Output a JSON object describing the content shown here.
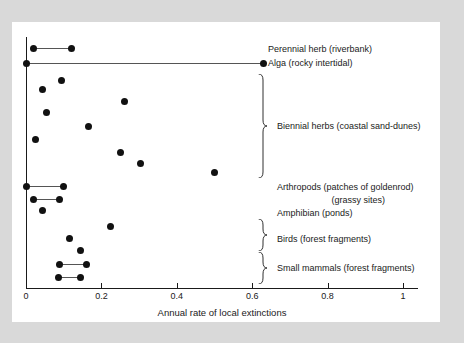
{
  "chart_data": {
    "type": "scatter",
    "title": "",
    "xlabel": "Annual rate of local extinctions",
    "ylabel": "",
    "xlim": [
      0,
      1.1
    ],
    "xticks": [
      0,
      0.2,
      0.4,
      0.6,
      0.8,
      1
    ],
    "xtick_labels": [
      "0",
      "0.2",
      "0.4",
      "0.6",
      "0.8",
      "1"
    ],
    "grid": false,
    "legend": "none",
    "groups": [
      {
        "name": "Perennial herb (riverbank)",
        "label": "Perennial herb (riverbank)",
        "brace": false,
        "rows": [
          {
            "values": [
              0.02,
              0.12
            ],
            "connected": true
          }
        ]
      },
      {
        "name": "Alga (rocky intertidal)",
        "label": "Alga (rocky intertidal)",
        "brace": false,
        "rows": [
          {
            "values": [
              0.0,
              0.63
            ],
            "connected": true
          }
        ]
      },
      {
        "name": "Biennial herbs (coastal sand-dunes)",
        "label": "Biennial herbs (coastal sand-dunes)",
        "brace": true,
        "rows": [
          {
            "values": [
              0.095
            ],
            "connected": false
          },
          {
            "values": [
              0.045
            ],
            "connected": false
          },
          {
            "values": [
              0.26
            ],
            "connected": false
          },
          {
            "values": [
              0.055
            ],
            "connected": false
          },
          {
            "values": [
              0.165
            ],
            "connected": false
          },
          {
            "values": [
              0.025
            ],
            "connected": false
          },
          {
            "values": [
              0.25
            ],
            "connected": false
          },
          {
            "values": [
              0.305
            ],
            "connected": false
          },
          {
            "values": [
              0.5
            ],
            "connected": false
          }
        ]
      },
      {
        "name": "Arthropods (patches of goldenrod)",
        "label": "Arthropods (patches of goldenrod)",
        "brace": false,
        "rows": [
          {
            "values": [
              0.0,
              0.1
            ],
            "connected": true
          }
        ]
      },
      {
        "name": "Arthropods (grassy sites)",
        "label": "(grassy sites)",
        "brace": false,
        "rows": [
          {
            "values": [
              0.02,
              0.09
            ],
            "connected": true
          }
        ]
      },
      {
        "name": "Amphibian (ponds)",
        "label": "Amphibian (ponds)",
        "brace": false,
        "rows": [
          {
            "values": [
              0.045
            ],
            "connected": false
          }
        ]
      },
      {
        "name": "Birds (forest fragments)",
        "label": "Birds (forest fragments)",
        "brace": true,
        "rows": [
          {
            "values": [
              0.225
            ],
            "connected": false
          },
          {
            "values": [
              0.115
            ],
            "connected": false
          },
          {
            "values": [
              0.145
            ],
            "connected": false
          }
        ]
      },
      {
        "name": "Small mammals (forest fragments)",
        "label": "Small mammals (forest fragments)",
        "brace": true,
        "rows": [
          {
            "values": [
              0.09,
              0.16
            ],
            "connected": true
          },
          {
            "values": [
              0.085,
              0.145
            ],
            "connected": true
          }
        ]
      }
    ],
    "points": [
      {
        "x": 0.02,
        "y_px": 48,
        "group": "Perennial herb (riverbank)"
      },
      {
        "x": 0.12,
        "y_px": 48,
        "group": "Perennial herb (riverbank)"
      },
      {
        "x": 0.0,
        "y_px": 63,
        "group": "Alga (rocky intertidal)"
      },
      {
        "x": 0.63,
        "y_px": 63,
        "group": "Alga (rocky intertidal)"
      },
      {
        "x": 0.095,
        "y_px": 80,
        "group": "Biennial herbs (coastal sand-dunes)"
      },
      {
        "x": 0.045,
        "y_px": 89,
        "group": "Biennial herbs (coastal sand-dunes)"
      },
      {
        "x": 0.26,
        "y_px": 101,
        "group": "Biennial herbs (coastal sand-dunes)"
      },
      {
        "x": 0.055,
        "y_px": 112,
        "group": "Biennial herbs (coastal sand-dunes)"
      },
      {
        "x": 0.165,
        "y_px": 126,
        "group": "Biennial herbs (coastal sand-dunes)"
      },
      {
        "x": 0.025,
        "y_px": 139,
        "group": "Biennial herbs (coastal sand-dunes)"
      },
      {
        "x": 0.25,
        "y_px": 152,
        "group": "Biennial herbs (coastal sand-dunes)"
      },
      {
        "x": 0.305,
        "y_px": 163,
        "group": "Biennial herbs (coastal sand-dunes)"
      },
      {
        "x": 0.5,
        "y_px": 172,
        "group": "Biennial herbs (coastal sand-dunes)"
      },
      {
        "x": 0.0,
        "y_px": 186,
        "group": "Arthropods (patches of goldenrod)"
      },
      {
        "x": 0.1,
        "y_px": 186,
        "group": "Arthropods (patches of goldenrod)"
      },
      {
        "x": 0.02,
        "y_px": 199,
        "group": "Arthropods (grassy sites)"
      },
      {
        "x": 0.09,
        "y_px": 199,
        "group": "Arthropods (grassy sites)"
      },
      {
        "x": 0.045,
        "y_px": 210,
        "group": "Amphibian (ponds)"
      },
      {
        "x": 0.225,
        "y_px": 226,
        "group": "Birds (forest fragments)"
      },
      {
        "x": 0.115,
        "y_px": 238,
        "group": "Birds (forest fragments)"
      },
      {
        "x": 0.145,
        "y_px": 250,
        "group": "Birds (forest fragments)"
      },
      {
        "x": 0.09,
        "y_px": 264,
        "group": "Small mammals (forest fragments)"
      },
      {
        "x": 0.16,
        "y_px": 264,
        "group": "Small mammals (forest fragments)"
      },
      {
        "x": 0.085,
        "y_px": 277,
        "group": "Small mammals (forest fragments)"
      },
      {
        "x": 0.145,
        "y_px": 277,
        "group": "Small mammals (forest fragments)"
      }
    ],
    "colors": {
      "marker": "#111111",
      "axis": "#1a1a1a",
      "range_line": "#555555",
      "panel_background": "#ffffff",
      "figure_background": "#d9d9d9"
    }
  },
  "annotations": {
    "labels": [
      {
        "text": "Perennial herb (riverbank)",
        "x_px": 268,
        "y_px": 44,
        "align": "left"
      },
      {
        "text": "Alga (rocky intertidal)",
        "x_px": 268,
        "y_px": 58,
        "align": "left"
      },
      {
        "text": "Biennial herbs (coastal sand-dunes)",
        "x_px": 277,
        "y_px": 121,
        "align": "left"
      },
      {
        "text": "Arthropods (patches of goldenrod)",
        "x_px": 277,
        "y_px": 182,
        "align": "left"
      },
      {
        "text": "(grassy sites)",
        "x_px": 385,
        "y_px": 195,
        "align": "right"
      },
      {
        "text": "Amphibian (ponds)",
        "x_px": 277,
        "y_px": 208,
        "align": "left"
      },
      {
        "text": "Birds (forest fragments)",
        "x_px": 277,
        "y_px": 234,
        "align": "left"
      },
      {
        "text": "Small mammals (forest fragments)",
        "x_px": 277,
        "y_px": 263,
        "align": "left"
      }
    ],
    "braces": [
      {
        "name": "biennial-herbs-brace",
        "x_px": 258,
        "top_px": 74,
        "height_px": 104
      },
      {
        "name": "birds-brace",
        "x_px": 258,
        "top_px": 219,
        "height_px": 32
      },
      {
        "name": "small-mammals-brace",
        "x_px": 258,
        "top_px": 252,
        "height_px": 32
      }
    ]
  }
}
